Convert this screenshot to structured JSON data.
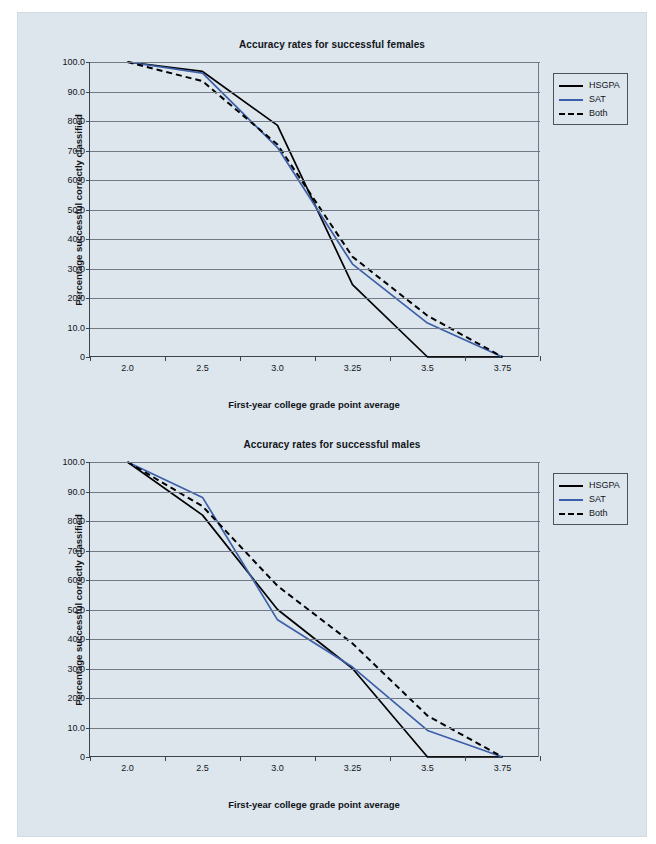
{
  "page": {
    "background_color": "#dde5ed",
    "paper_color": "#ffffff"
  },
  "charts": [
    {
      "id": "females",
      "title": "Accuracy rates for successful females",
      "xlabel": "First-year college grade point average",
      "ylabel": "Percentage successful correctly classified"
    },
    {
      "id": "males",
      "title": "Accuracy rates for successful males",
      "xlabel": "First-year college grade point average",
      "ylabel": "Percentage successful correctly classified"
    }
  ],
  "legend": {
    "position": "right",
    "items": [
      {
        "label": "HSGPA",
        "style": "solid",
        "color": "#000000",
        "swatch": "sw-solid-black"
      },
      {
        "label": "SAT",
        "style": "solid",
        "color": "#3b5fa8",
        "swatch": "sw-solid-blue"
      },
      {
        "label": "Both",
        "style": "dashed",
        "color": "#000000",
        "swatch": "sw-dashed"
      }
    ]
  },
  "axis": {
    "y_ticks": [
      "100.0",
      "90.0",
      "80.0",
      "70.0",
      "60.0",
      "50.0",
      "40.0",
      "30.0",
      "20.0",
      "10.0",
      "0"
    ],
    "y_values": [
      100,
      90,
      80,
      70,
      60,
      50,
      40,
      30,
      20,
      10,
      0
    ],
    "x_ticks": [
      "2.0",
      "2.5",
      "3.0",
      "3.25",
      "3.5",
      "3.75"
    ]
  },
  "chart_data": [
    {
      "type": "line",
      "title": "Accuracy rates for successful females",
      "xlabel": "First-year college grade point average",
      "ylabel": "Percentage successful correctly classified",
      "categories": [
        "2.0",
        "2.5",
        "3.0",
        "3.25",
        "3.5",
        "3.75"
      ],
      "ylim": [
        0,
        100
      ],
      "grid": true,
      "legend": "upper right outside",
      "series": [
        {
          "name": "HSGPA",
          "color": "#000000",
          "dash": "solid",
          "values": [
            100.0,
            96.8,
            78.5,
            24.5,
            0.0,
            0.0
          ]
        },
        {
          "name": "SAT",
          "color": "#3b5fa8",
          "dash": "solid",
          "values": [
            100.0,
            96.2,
            71.0,
            31.5,
            11.5,
            0.0
          ]
        },
        {
          "name": "Both",
          "color": "#000000",
          "dash": "dashed",
          "values": [
            100.0,
            93.5,
            72.0,
            34.0,
            14.0,
            0.0
          ]
        }
      ]
    },
    {
      "type": "line",
      "title": "Accuracy rates for successful males",
      "xlabel": "First-year college grade point average",
      "ylabel": "Percentage successful correctly classified",
      "categories": [
        "2.0",
        "2.5",
        "3.0",
        "3.25",
        "3.5",
        "3.75"
      ],
      "ylim": [
        0,
        100
      ],
      "grid": true,
      "legend": "upper right outside",
      "series": [
        {
          "name": "HSGPA",
          "color": "#000000",
          "dash": "solid",
          "values": [
            100.0,
            82.0,
            50.0,
            30.0,
            0.0,
            0.0
          ]
        },
        {
          "name": "SAT",
          "color": "#3b5fa8",
          "dash": "solid",
          "values": [
            100.0,
            88.0,
            46.5,
            30.5,
            9.0,
            0.0
          ]
        },
        {
          "name": "Both",
          "color": "#000000",
          "dash": "dashed",
          "values": [
            100.0,
            85.0,
            58.0,
            38.5,
            14.0,
            0.0
          ]
        }
      ]
    }
  ]
}
